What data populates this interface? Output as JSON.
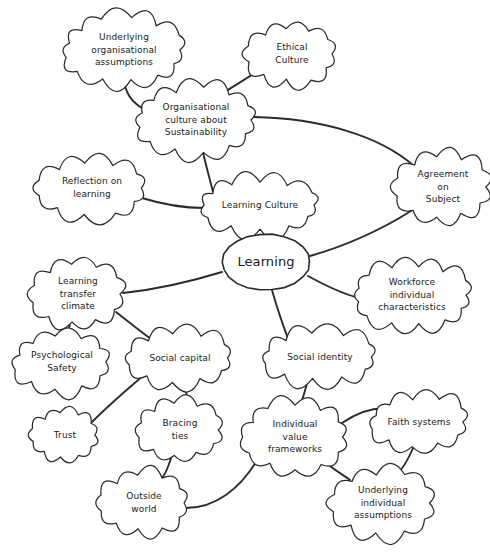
{
  "diagram": {
    "type": "mind-map",
    "style": "hand-drawn",
    "title": "Learning",
    "center": {
      "id": "learning",
      "label": "Learning",
      "shape": "ellipse",
      "x": 266,
      "y": 262,
      "rx": 44,
      "ry": 28,
      "font_size": 13
    },
    "nodes": [
      {
        "id": "underlying-organisational-assumptions",
        "label": "Underlying organisational assumptions",
        "lines": [
          "Underlying",
          "organisational",
          "assumptions"
        ],
        "shape": "cloud",
        "x": 124,
        "y": 50,
        "rx": 60,
        "ry": 31,
        "font_size": 9
      },
      {
        "id": "ethical-culture",
        "label": "Ethical Culture",
        "lines": [
          "Ethical",
          "Culture"
        ],
        "shape": "cloud",
        "x": 292,
        "y": 54,
        "rx": 43,
        "ry": 27,
        "font_size": 9
      },
      {
        "id": "organisational-culture-about-sustainability",
        "label": "Organisational culture about Sustainability",
        "lines": [
          "Organisational",
          "culture about",
          "Sustainability"
        ],
        "shape": "cloud",
        "x": 196,
        "y": 120,
        "rx": 59,
        "ry": 31,
        "font_size": 9
      },
      {
        "id": "reflection-on-learning",
        "label": "Reflection on learning",
        "lines": [
          "Reflection on",
          "learning"
        ],
        "shape": "cloud",
        "x": 92,
        "y": 188,
        "rx": 53,
        "ry": 26,
        "font_size": 9
      },
      {
        "id": "learning-culture",
        "label": "Learning Culture",
        "lines": [
          "Learning Culture"
        ],
        "shape": "cloud",
        "x": 260,
        "y": 205,
        "rx": 58,
        "ry": 24,
        "font_size": 9
      },
      {
        "id": "agreement-on-subject",
        "label": "Agreement on Subject",
        "lines": [
          "Agreement",
          "on",
          "Subject"
        ],
        "shape": "cloud",
        "x": 443,
        "y": 187,
        "rx": 46,
        "ry": 31,
        "font_size": 9
      },
      {
        "id": "workforce-individual-characteristics",
        "label": "Workforce individual characteristics",
        "lines": [
          "Workforce",
          "individual",
          "characteristics"
        ],
        "shape": "cloud",
        "x": 412,
        "y": 295,
        "rx": 58,
        "ry": 30,
        "font_size": 9
      },
      {
        "id": "learning-transfer-climate",
        "label": "Learning transfer climate",
        "lines": [
          "Learning",
          "transfer",
          "climate"
        ],
        "shape": "cloud",
        "x": 78,
        "y": 294,
        "rx": 45,
        "ry": 30,
        "font_size": 9
      },
      {
        "id": "psychological-safety",
        "label": "Psychological Safety",
        "lines": [
          "Psychological",
          "Safety"
        ],
        "shape": "cloud",
        "x": 62,
        "y": 362,
        "rx": 47,
        "ry": 26,
        "font_size": 9
      },
      {
        "id": "social-capital",
        "label": "Social capital",
        "lines": [
          "Social capital"
        ],
        "shape": "cloud",
        "x": 180,
        "y": 358,
        "rx": 51,
        "ry": 24,
        "font_size": 9
      },
      {
        "id": "trust",
        "label": "Trust",
        "lines": [
          "Trust"
        ],
        "shape": "cloud",
        "x": 65,
        "y": 435,
        "rx": 32,
        "ry": 22,
        "font_size": 9
      },
      {
        "id": "bracing-ties",
        "label": "Bracing ties",
        "lines": [
          "Bracing",
          "ties"
        ],
        "shape": "cloud",
        "x": 180,
        "y": 430,
        "rx": 41,
        "ry": 26,
        "font_size": 9
      },
      {
        "id": "outside-world",
        "label": "Outside world",
        "lines": [
          "Outside",
          "world"
        ],
        "shape": "cloud",
        "x": 144,
        "y": 503,
        "rx": 43,
        "ry": 27,
        "font_size": 9
      },
      {
        "id": "social-identity",
        "label": "Social identity",
        "lines": [
          "Social identity"
        ],
        "shape": "cloud",
        "x": 320,
        "y": 357,
        "rx": 55,
        "ry": 23,
        "font_size": 9
      },
      {
        "id": "individual-value-frameworks",
        "label": "Individual value frameworks",
        "lines": [
          "Individual",
          "value",
          "frameworks"
        ],
        "shape": "cloud",
        "x": 295,
        "y": 437,
        "rx": 51,
        "ry": 31,
        "font_size": 9
      },
      {
        "id": "faith-systems",
        "label": "Faith systems",
        "lines": [
          "Faith systems"
        ],
        "shape": "cloud",
        "x": 419,
        "y": 422,
        "rx": 47,
        "ry": 24,
        "font_size": 9
      },
      {
        "id": "underlying-individual-assumptions",
        "label": "Underlying individual assumptions",
        "lines": [
          "Underlying",
          "individual",
          "assumptions"
        ],
        "shape": "cloud",
        "x": 383,
        "y": 503,
        "rx": 50,
        "ry": 30,
        "font_size": 9
      }
    ],
    "edges": [
      {
        "from": "underlying-organisational-assumptions",
        "to": "organisational-culture-about-sustainability",
        "path": "M 124,82 C 127,96 133,103 145,110"
      },
      {
        "from": "ethical-culture",
        "to": "organisational-culture-about-sustainability",
        "path": "M 256,72 C 238,84 224,92 212,100"
      },
      {
        "from": "organisational-culture-about-sustainability",
        "to": "learning-culture",
        "path": "M 203,152 C 206,166 209,176 213,192"
      },
      {
        "from": "organisational-culture-about-sustainability",
        "to": "agreement-on-subject",
        "path": "M 254,117 C 320,118 380,136 414,166"
      },
      {
        "from": "reflection-on-learning",
        "to": "learning-culture",
        "path": "M 142,198 C 168,206 186,208 204,208"
      },
      {
        "from": "learning-culture",
        "to": "learning",
        "path": "M 268,229 C 270,240 272,248 274,236"
      },
      {
        "from": "agreement-on-subject",
        "to": "learning",
        "path": "M 411,211 C 376,233 338,248 310,256"
      },
      {
        "from": "learning",
        "to": "workforce-individual-characteristics",
        "path": "M 308,276 C 330,288 344,294 356,297"
      },
      {
        "from": "learning",
        "to": "learning-transfer-climate",
        "path": "M 222,272 C 186,283 152,290 123,293"
      },
      {
        "from": "learning",
        "to": "social-identity",
        "path": "M 272,290 C 278,312 284,328 290,344"
      },
      {
        "from": "learning-transfer-climate",
        "to": "psychological-safety",
        "path": "M 70,323 C 68,334 66,340 64,337"
      },
      {
        "from": "learning-transfer-climate",
        "to": "social-capital",
        "path": "M 116,312 C 134,326 148,338 160,345"
      },
      {
        "from": "social-capital",
        "to": "trust",
        "path": "M 144,375 C 124,392 106,408 92,422"
      },
      {
        "from": "social-capital",
        "to": "bracing-ties",
        "path": "M 185,382 C 187,396 187,406 187,405"
      },
      {
        "from": "bracing-ties",
        "to": "outside-world",
        "path": "M 172,455 C 168,468 164,478 160,479"
      },
      {
        "from": "outside-world",
        "to": "individual-value-frameworks",
        "path": "M 186,508 C 216,508 240,488 256,462"
      },
      {
        "from": "social-identity",
        "to": "individual-value-frameworks",
        "path": "M 308,379 C 304,396 300,408 297,406"
      },
      {
        "from": "individual-value-frameworks",
        "to": "faith-systems",
        "path": "M 342,423 C 358,412 376,406 393,409"
      },
      {
        "from": "individual-value-frameworks",
        "to": "underlying-individual-assumptions",
        "path": "M 326,463 C 340,474 348,478 350,480"
      },
      {
        "from": "faith-systems",
        "to": "underlying-individual-assumptions",
        "path": "M 414,446 C 408,460 402,470 396,475"
      }
    ]
  }
}
